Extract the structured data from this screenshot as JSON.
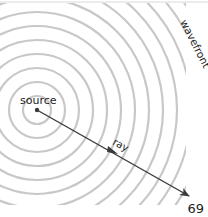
{
  "diagram": {
    "labels": {
      "source": "source",
      "wavefront": "wavefront",
      "ray": "ray"
    },
    "source_point": {
      "x": 37,
      "y": 110
    },
    "ray": {
      "from": {
        "x": 37,
        "y": 110
      },
      "to": {
        "x": 189,
        "y": 196
      }
    },
    "ring_spacing": 14,
    "ring_count": 15,
    "colors": {
      "rings": "#c8c8c8",
      "ray": "#3a3a3a",
      "text": "#222222",
      "border": "#d9d9d9"
    }
  },
  "page": {
    "number": "69"
  }
}
